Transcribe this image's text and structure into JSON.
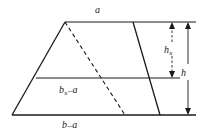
{
  "figure": {
    "type": "geometry-diagram",
    "shape": "trapezoid",
    "background_color": "#ffffff",
    "line_color": "#1a1a1a",
    "labels": {
      "top_side": {
        "base": "a",
        "subscript": "",
        "operator": "",
        "operand": ""
      },
      "middle_side": {
        "base": "b",
        "subscript": "x",
        "operator": "–",
        "operand": "a"
      },
      "bottom_side": {
        "base": "b",
        "subscript": "",
        "operator": "–",
        "operand": "a"
      },
      "partial_height": {
        "base": "h",
        "subscript": "x",
        "operator": "",
        "operand": ""
      },
      "total_height": {
        "base": "h",
        "subscript": "",
        "operator": "",
        "operand": ""
      }
    },
    "geometry": {
      "top_left": [
        65,
        22
      ],
      "top_right": [
        133,
        22
      ],
      "bottom_right": [
        160,
        115
      ],
      "bottom_left": [
        12,
        115
      ],
      "middle_line_y": 78,
      "middle_line_x_start": 36,
      "middle_line_x_end": 180,
      "top_extension_x_end": 196,
      "bottom_extension_x_end": 196,
      "dashed_line_start": [
        65,
        22
      ],
      "dashed_line_end": [
        125,
        115
      ],
      "dimension_hx_x": 172,
      "dimension_h_x": 188
    }
  }
}
